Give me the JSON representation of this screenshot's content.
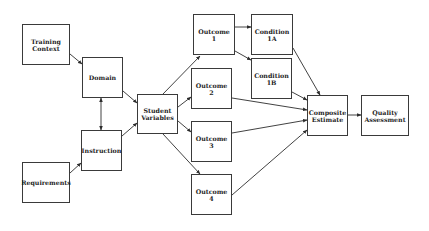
{
  "diagram": {
    "type": "flowchart",
    "nodes": [
      {
        "id": "training_context",
        "label": "Training\nContext",
        "x": 22,
        "y": 24,
        "w": 48,
        "h": 41
      },
      {
        "id": "domain",
        "label": "Domain",
        "x": 82,
        "y": 57,
        "w": 41,
        "h": 41
      },
      {
        "id": "instruction",
        "label": "Instruction",
        "x": 81,
        "y": 130,
        "w": 41,
        "h": 41
      },
      {
        "id": "requirements",
        "label": "Requirements",
        "x": 22,
        "y": 162,
        "w": 48,
        "h": 41
      },
      {
        "id": "student_variables",
        "label": "Student\nVariables",
        "x": 137,
        "y": 94,
        "w": 41,
        "h": 40
      },
      {
        "id": "outcome_1",
        "label": "Outcome\n1",
        "x": 193,
        "y": 14,
        "w": 42,
        "h": 41
      },
      {
        "id": "outcome_2",
        "label": "Outcome\n2",
        "x": 191,
        "y": 68,
        "w": 41,
        "h": 41
      },
      {
        "id": "outcome_3",
        "label": "Outcome\n3",
        "x": 191,
        "y": 121,
        "w": 41,
        "h": 41
      },
      {
        "id": "outcome_4",
        "label": "Outcome\n4",
        "x": 191,
        "y": 174,
        "w": 41,
        "h": 41
      },
      {
        "id": "condition_1a",
        "label": "Condition\n1A",
        "x": 251,
        "y": 14,
        "w": 42,
        "h": 41
      },
      {
        "id": "condition_1b",
        "label": "Condition\n1B",
        "x": 251,
        "y": 58,
        "w": 41,
        "h": 41
      },
      {
        "id": "composite_estimate",
        "label": "Composite\nEstimate",
        "x": 307,
        "y": 95,
        "w": 41,
        "h": 41
      },
      {
        "id": "quality_assessment",
        "label": "Quality\nAssessment",
        "x": 361,
        "y": 95,
        "w": 48,
        "h": 41
      }
    ],
    "edges": [
      {
        "from": "training_context",
        "to": "domain",
        "x1": 70,
        "y1": 54,
        "x2": 82,
        "y2": 64,
        "arrow": "end"
      },
      {
        "from": "domain",
        "to": "instruction",
        "x1": 101,
        "y1": 98,
        "x2": 101,
        "y2": 130,
        "arrow": "both"
      },
      {
        "from": "requirements",
        "to": "instruction",
        "x1": 70,
        "y1": 173,
        "x2": 81,
        "y2": 163,
        "arrow": "end"
      },
      {
        "from": "domain",
        "to": "student_variables",
        "x1": 123,
        "y1": 91,
        "x2": 137,
        "y2": 103,
        "arrow": "end"
      },
      {
        "from": "instruction",
        "to": "student_variables",
        "x1": 122,
        "y1": 136,
        "x2": 137,
        "y2": 123,
        "arrow": "end"
      },
      {
        "from": "student_variables",
        "to": "outcome_1",
        "x1": 163,
        "y1": 94,
        "x2": 200,
        "y2": 56,
        "arrow": "end"
      },
      {
        "from": "student_variables",
        "to": "outcome_2",
        "x1": 178,
        "y1": 107,
        "x2": 191,
        "y2": 97,
        "arrow": "end"
      },
      {
        "from": "student_variables",
        "to": "outcome_3",
        "x1": 178,
        "y1": 121,
        "x2": 191,
        "y2": 132,
        "arrow": "end"
      },
      {
        "from": "student_variables",
        "to": "outcome_4",
        "x1": 163,
        "y1": 134,
        "x2": 200,
        "y2": 174,
        "arrow": "end"
      },
      {
        "from": "outcome_1",
        "to": "condition_1a",
        "x1": 235,
        "y1": 27,
        "x2": 251,
        "y2": 27,
        "arrow": "end"
      },
      {
        "from": "outcome_1",
        "to": "condition_1b",
        "x1": 235,
        "y1": 51,
        "x2": 251,
        "y2": 60,
        "arrow": "end"
      },
      {
        "from": "condition_1a",
        "to": "composite_estimate",
        "x1": 293,
        "y1": 48,
        "x2": 320,
        "y2": 95,
        "arrow": "end"
      },
      {
        "from": "condition_1b",
        "to": "composite_estimate",
        "x1": 292,
        "y1": 92,
        "x2": 307,
        "y2": 100,
        "arrow": "end"
      },
      {
        "from": "outcome_2",
        "to": "composite_estimate",
        "x1": 232,
        "y1": 98,
        "x2": 307,
        "y2": 110,
        "arrow": "end"
      },
      {
        "from": "outcome_3",
        "to": "composite_estimate",
        "x1": 232,
        "y1": 133,
        "x2": 307,
        "y2": 120,
        "arrow": "end"
      },
      {
        "from": "outcome_4",
        "to": "composite_estimate",
        "x1": 232,
        "y1": 195,
        "x2": 307,
        "y2": 130,
        "arrow": "end"
      },
      {
        "from": "composite_estimate",
        "to": "quality_assessment",
        "x1": 348,
        "y1": 115,
        "x2": 361,
        "y2": 115,
        "arrow": "end"
      }
    ]
  },
  "colors": {
    "background": "#ffffff",
    "stroke": "#2c2c2c",
    "text": "#1e1e1e"
  }
}
